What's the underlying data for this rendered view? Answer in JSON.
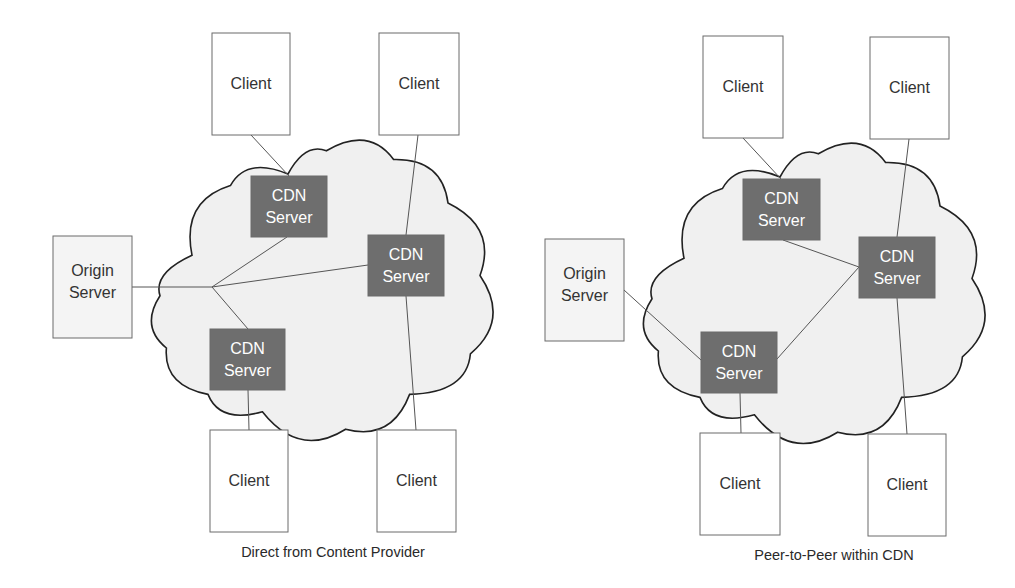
{
  "colors": {
    "background": "#ffffff",
    "box_stroke": "#6b6b6b",
    "client_fill": "#ffffff",
    "origin_fill": "#f4f4f4",
    "cdn_fill": "#6e6e6e",
    "cdn_text": "#ffffff",
    "cloud_fill": "#f0f0f0",
    "cloud_stroke": "#222222",
    "link_stroke": "#555555",
    "text": "#333333"
  },
  "diagrams": [
    {
      "id": "direct",
      "caption": "Direct from Content Provider",
      "caption_pos": {
        "x": 333,
        "y": 544
      },
      "cloud": {
        "x": 160,
        "y": 145,
        "w": 320,
        "h": 290
      },
      "nodes": [
        {
          "id": "client-top-left",
          "type": "client",
          "label": [
            "Client"
          ],
          "x": 212,
          "y": 33,
          "w": 78,
          "h": 102
        },
        {
          "id": "client-top-right",
          "type": "client",
          "label": [
            "Client"
          ],
          "x": 379,
          "y": 33,
          "w": 80,
          "h": 102
        },
        {
          "id": "origin-server",
          "type": "origin",
          "label": [
            "Origin",
            "Server"
          ],
          "x": 53,
          "y": 236,
          "w": 79,
          "h": 102
        },
        {
          "id": "cdn-server-1",
          "type": "cdn",
          "label": [
            "CDN",
            "Server"
          ],
          "x": 251,
          "y": 176,
          "w": 76,
          "h": 61
        },
        {
          "id": "cdn-server-2",
          "type": "cdn",
          "label": [
            "CDN",
            "Server"
          ],
          "x": 368,
          "y": 235,
          "w": 76,
          "h": 61
        },
        {
          "id": "cdn-server-3",
          "type": "cdn",
          "label": [
            "CDN",
            "Server"
          ],
          "x": 210,
          "y": 329,
          "w": 75,
          "h": 61
        },
        {
          "id": "client-bottom-left",
          "type": "client",
          "label": [
            "Client"
          ],
          "x": 210,
          "y": 430,
          "w": 78,
          "h": 102
        },
        {
          "id": "client-bottom-right",
          "type": "client",
          "label": [
            "Client"
          ],
          "x": 377,
          "y": 430,
          "w": 79,
          "h": 102
        }
      ],
      "links": [
        [
          251,
          135,
          289,
          176
        ],
        [
          418,
          135,
          406,
          235
        ],
        [
          132,
          287,
          212,
          287
        ],
        [
          212,
          287,
          287,
          237
        ],
        [
          212,
          287,
          368,
          265
        ],
        [
          212,
          287,
          248,
          329
        ],
        [
          248,
          390,
          249,
          430
        ],
        [
          406,
          296,
          416,
          430
        ]
      ]
    },
    {
      "id": "p2p",
      "caption": "Peer-to-Peer within CDN",
      "caption_pos": {
        "x": 834,
        "y": 547
      },
      "cloud": {
        "x": 652,
        "y": 148,
        "w": 320,
        "h": 290
      },
      "nodes": [
        {
          "id": "client-top-left",
          "type": "client",
          "label": [
            "Client"
          ],
          "x": 703,
          "y": 36,
          "w": 80,
          "h": 102
        },
        {
          "id": "client-top-right",
          "type": "client",
          "label": [
            "Client"
          ],
          "x": 870,
          "y": 37,
          "w": 79,
          "h": 102
        },
        {
          "id": "origin-server",
          "type": "origin",
          "label": [
            "Origin",
            "Server"
          ],
          "x": 545,
          "y": 239,
          "w": 79,
          "h": 102
        },
        {
          "id": "cdn-server-1",
          "type": "cdn",
          "label": [
            "CDN",
            "Server"
          ],
          "x": 743,
          "y": 179,
          "w": 77,
          "h": 61
        },
        {
          "id": "cdn-server-2",
          "type": "cdn",
          "label": [
            "CDN",
            "Server"
          ],
          "x": 859,
          "y": 237,
          "w": 76,
          "h": 61
        },
        {
          "id": "cdn-server-3",
          "type": "cdn",
          "label": [
            "CDN",
            "Server"
          ],
          "x": 701,
          "y": 332,
          "w": 76,
          "h": 61
        },
        {
          "id": "client-bottom-left",
          "type": "client",
          "label": [
            "Client"
          ],
          "x": 700,
          "y": 433,
          "w": 80,
          "h": 102
        },
        {
          "id": "client-bottom-right",
          "type": "client",
          "label": [
            "Client"
          ],
          "x": 868,
          "y": 434,
          "w": 78,
          "h": 102
        }
      ],
      "links": [
        [
          743,
          138,
          781,
          179
        ],
        [
          909,
          139,
          897,
          237
        ],
        [
          624,
          290,
          701,
          360
        ],
        [
          783,
          240,
          859,
          267
        ],
        [
          777,
          359,
          859,
          267
        ],
        [
          740,
          393,
          741,
          433
        ],
        [
          897,
          298,
          907,
          434
        ]
      ]
    }
  ]
}
